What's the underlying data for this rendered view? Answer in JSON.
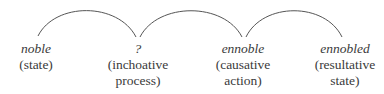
{
  "diagram": {
    "nodes": [
      {
        "word": "noble",
        "gloss_lines": [
          "(state)"
        ]
      },
      {
        "word": "?",
        "gloss_lines": [
          "(inchoative",
          "process)"
        ]
      },
      {
        "word": "ennoble",
        "gloss_lines": [
          "(causative",
          "action)"
        ]
      },
      {
        "word": "ennobled",
        "gloss_lines": [
          "(resultative",
          "state)"
        ]
      }
    ],
    "arcs": [
      {
        "from": "noble",
        "to": "?"
      },
      {
        "from": "?",
        "to": "ennoble"
      },
      {
        "from": "ennoble",
        "to": "ennobled"
      }
    ],
    "colors": {
      "text": "#3a3a3a",
      "arc": "#555555"
    }
  }
}
